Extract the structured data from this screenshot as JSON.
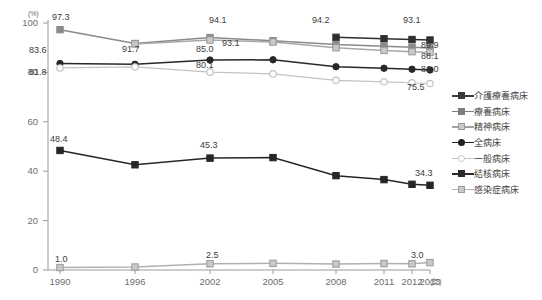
{
  "chart_data": {
    "type": "line",
    "title": "",
    "xlabel": "(年)",
    "ylabel": "(%)",
    "ylim": [
      0,
      100
    ],
    "yticks": [
      "0",
      "20",
      "40",
      "60",
      "80",
      "100"
    ],
    "categories": [
      "1990",
      "1996",
      "2002",
      "2005",
      "2008",
      "2011",
      "2012",
      "2013"
    ],
    "grid": false,
    "legend_position": "right",
    "series": [
      {
        "name": "介護療養病床",
        "marker": "filled-square",
        "color": "#2f2f2f",
        "values": [
          null,
          null,
          null,
          null,
          94.2,
          93.6,
          93.3,
          93.1
        ],
        "labels": {
          "2008": "94.2",
          "2013": "93.1"
        }
      },
      {
        "name": "療養病床",
        "marker": "gray-square",
        "color": "#8a8a8a",
        "values": [
          97.3,
          91.7,
          94.1,
          92.8,
          91.3,
          90.6,
          90.2,
          89.9
        ],
        "labels": {
          "1990": "97.3",
          "2002": "94.1",
          "2013": "89.9"
        }
      },
      {
        "name": "精神病床",
        "marker": "light-square",
        "color": "#a8a8a8",
        "values": [
          null,
          91.5,
          93.1,
          92.3,
          90.0,
          88.9,
          88.4,
          88.1
        ],
        "labels": {
          "1996": "91.7",
          "2002": "93.1",
          "2013": "88.1"
        }
      },
      {
        "name": "全病床",
        "marker": "filled-circle",
        "color": "#282828",
        "values": [
          83.6,
          83.3,
          85.0,
          85.1,
          82.3,
          81.7,
          81.3,
          81.0
        ],
        "labels": {
          "1990": "83.6",
          "2002": "85.0",
          "2013": "81.0"
        }
      },
      {
        "name": "一般病床",
        "marker": "open-circle",
        "color": "#c2c2c2",
        "values": [
          81.8,
          82.2,
          80.1,
          79.4,
          76.8,
          76.2,
          75.8,
          75.5
        ],
        "labels": {
          "1990": "81.8",
          "2002": "80.1",
          "2013": "75.5"
        }
      },
      {
        "name": "結核病床",
        "marker": "filled-square",
        "color": "#262626",
        "values": [
          48.4,
          42.6,
          45.3,
          45.5,
          38.2,
          36.6,
          34.7,
          34.3
        ],
        "labels": {
          "1990": "48.4",
          "2002": "45.3",
          "2013": "34.3"
        }
      },
      {
        "name": "感染症病床",
        "marker": "light-square",
        "color": "#b0b0b0",
        "values": [
          1.0,
          1.2,
          2.5,
          2.7,
          2.4,
          2.6,
          2.5,
          3.0
        ],
        "labels": {
          "1990": "1.0",
          "2002": "2.5",
          "2013": "3.0"
        }
      }
    ],
    "point_labels": [
      {
        "id": "l_973",
        "text": "97.3",
        "x": 52,
        "y": 12,
        "tone": "dark"
      },
      {
        "id": "l_917",
        "text": "91.7",
        "x": 122,
        "y": 44,
        "tone": "dark"
      },
      {
        "id": "l_941",
        "text": "94.1",
        "x": 209,
        "y": 15,
        "tone": "dark"
      },
      {
        "id": "l_931a",
        "text": "93.1",
        "x": 222,
        "y": 38,
        "tone": "dark"
      },
      {
        "id": "l_942",
        "text": "94.2",
        "x": 312,
        "y": 15,
        "tone": "dark"
      },
      {
        "id": "l_931b",
        "text": "93.1",
        "x": 403,
        "y": 15,
        "tone": "dark"
      },
      {
        "id": "l_899",
        "text": "89.9",
        "x": 421,
        "y": 40,
        "tone": "dark"
      },
      {
        "id": "l_881",
        "text": "88.1",
        "x": 421,
        "y": 51,
        "tone": "dark"
      },
      {
        "id": "l_836",
        "text": "83.6",
        "x": 29,
        "y": 45,
        "tone": "dark"
      },
      {
        "id": "l_850",
        "text": "85.0",
        "x": 196,
        "y": 44,
        "tone": "dark"
      },
      {
        "id": "l_810",
        "text": "81.0",
        "x": 421,
        "y": 64,
        "tone": "dark"
      },
      {
        "id": "l_818",
        "text": "81.8",
        "x": 29,
        "y": 67,
        "tone": "dark"
      },
      {
        "id": "l_801",
        "text": "80.1",
        "x": 196,
        "y": 60,
        "tone": "dark"
      },
      {
        "id": "l_755",
        "text": "75.5",
        "x": 407,
        "y": 82,
        "tone": "dark"
      },
      {
        "id": "l_484",
        "text": "48.4",
        "x": 50,
        "y": 134,
        "tone": "dark"
      },
      {
        "id": "l_453",
        "text": "45.3",
        "x": 200,
        "y": 140,
        "tone": "dark"
      },
      {
        "id": "l_343",
        "text": "34.3",
        "x": 415,
        "y": 168,
        "tone": "dark"
      },
      {
        "id": "l_10",
        "text": "1.0",
        "x": 55,
        "y": 254,
        "tone": "dark"
      },
      {
        "id": "l_25",
        "text": "2.5",
        "x": 206,
        "y": 250,
        "tone": "dark"
      },
      {
        "id": "l_30",
        "text": "3.0",
        "x": 411,
        "y": 250,
        "tone": "dark"
      }
    ]
  },
  "legend": {
    "items": [
      {
        "label": "介護療養病床",
        "marker": "filled-square",
        "color": "#3a3a3a"
      },
      {
        "label": "療養病床",
        "marker": "gray-square",
        "color": "#7d7d7d"
      },
      {
        "label": "精神病床",
        "marker": "light-square",
        "color": "#a0a0a0"
      },
      {
        "label": "全病床",
        "marker": "filled-circle",
        "color": "#202020"
      },
      {
        "label": "一般病床",
        "marker": "open-circle",
        "color": "#c4c4c4"
      },
      {
        "label": "結核病床",
        "marker": "filled-square",
        "color": "#2a2a2a"
      },
      {
        "label": "感染症病床",
        "marker": "light-square",
        "color": "#b4b4b4"
      }
    ]
  },
  "axes": {
    "y_unit": "(%)",
    "x_unit": "(年)",
    "yticks": [
      {
        "value": "100",
        "x": 14,
        "y": 18
      },
      {
        "value": "80",
        "x": 14,
        "y": 66
      },
      {
        "value": "60",
        "x": 14,
        "y": 114
      },
      {
        "value": "40",
        "x": 14,
        "y": 162
      },
      {
        "value": "20",
        "x": 14,
        "y": 210
      },
      {
        "value": "0",
        "x": 14,
        "y": 267
      }
    ],
    "xticks": [
      {
        "value": "1990",
        "x": 38
      },
      {
        "value": "1996",
        "x": 113
      },
      {
        "value": "2002",
        "x": 188
      },
      {
        "value": "2005",
        "x": 251
      },
      {
        "value": "2008",
        "x": 314
      },
      {
        "value": "2011",
        "x": 362
      },
      {
        "value": "2012",
        "x": 390
      },
      {
        "value": "2013",
        "x": 418
      }
    ]
  }
}
